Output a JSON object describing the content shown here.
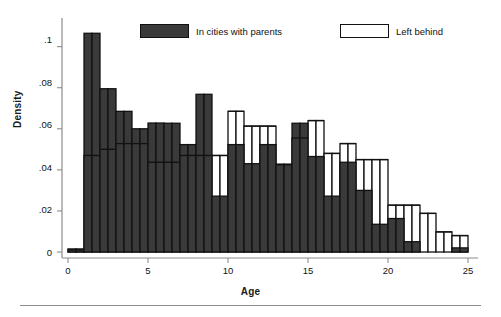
{
  "figure": {
    "x_axis_title": "Age",
    "y_axis_title": "Density",
    "y_ticks": [
      "0",
      ".02",
      ".04",
      ".06",
      ".08",
      ".1"
    ],
    "x_ticks": [
      "0",
      "5",
      "10",
      "15",
      "20",
      "25"
    ]
  },
  "legend": {
    "position": "top-inside",
    "items": [
      {
        "label": "In cities with parents",
        "style": "filled",
        "color": "#3a3a3a"
      },
      {
        "label": "Left behind",
        "style": "hollow",
        "color": "#ffffff"
      }
    ]
  },
  "colors": {
    "filled_bar": "#3a3a3a",
    "hollow_bar": "#ffffff",
    "bar_outline": "#111111",
    "axis": "#8c8c8c",
    "text": "#111111"
  },
  "chart_data": {
    "type": "bar",
    "subtype": "overlaid-histogram",
    "title": "",
    "xlabel": "Age",
    "ylabel": "Density",
    "xlim": [
      0,
      25
    ],
    "ylim": [
      0,
      0.112
    ],
    "bin_width": 0.5,
    "grid": false,
    "legend": [
      "In cities with parents",
      "Left behind"
    ],
    "x": [
      0.25,
      0.75,
      1.25,
      1.75,
      2.25,
      2.75,
      3.25,
      3.75,
      4.25,
      4.75,
      5.25,
      5.75,
      6.25,
      6.75,
      7.25,
      7.75,
      8.25,
      8.75,
      9.25,
      9.75,
      10.25,
      10.75,
      11.25,
      11.75,
      12.25,
      12.75,
      13.25,
      13.75,
      14.25,
      14.75,
      15.25,
      15.75,
      16.25,
      16.75,
      17.25,
      17.75,
      18.25,
      18.75,
      19.25,
      19.75,
      20.25,
      20.75,
      21.25,
      21.75,
      22.25,
      22.75,
      23.25,
      23.75,
      24.25,
      24.75
    ],
    "bin_left_edges": [
      0,
      0.5,
      1,
      1.5,
      2,
      2.5,
      3,
      3.5,
      4,
      4.5,
      5,
      5.5,
      6,
      6.5,
      7,
      7.5,
      8,
      8.5,
      9,
      9.5,
      10,
      10.5,
      11,
      11.5,
      12,
      12.5,
      13,
      13.5,
      14,
      14.5,
      15,
      15.5,
      16,
      16.5,
      17,
      17.5,
      18,
      18.5,
      19,
      19.5,
      20,
      20.5,
      21,
      21.5,
      22,
      22.5,
      23,
      23.5,
      24,
      24.5
    ],
    "series": [
      {
        "name": "In cities with parents",
        "style": "filled",
        "values": [
          0.0015,
          0.0015,
          0.1065,
          0.1065,
          0.0795,
          0.0795,
          0.0685,
          0.0685,
          0.06,
          0.06,
          0.0628,
          0.0628,
          0.0627,
          0.0627,
          0.0523,
          0.0523,
          0.0768,
          0.0768,
          0.0272,
          0.0272,
          0.0523,
          0.0523,
          0.043,
          0.043,
          0.0523,
          0.0523,
          0.0428,
          0.0428,
          0.0627,
          0.0627,
          0.0465,
          0.0465,
          0.0272,
          0.0272,
          0.0437,
          0.0437,
          0.03,
          0.03,
          0.0135,
          0.0135,
          0.0163,
          0.0163,
          0.005,
          0.005,
          0.0,
          0.0,
          0.0,
          0.0,
          0.002,
          0.002
        ]
      },
      {
        "name": "Left behind",
        "style": "hollow",
        "values": [
          0.001,
          0.001,
          0.047,
          0.047,
          0.05,
          0.05,
          0.0528,
          0.0528,
          0.0528,
          0.0528,
          0.0437,
          0.0437,
          0.0437,
          0.0437,
          0.047,
          0.047,
          0.047,
          0.047,
          0.047,
          0.047,
          0.0685,
          0.0685,
          0.0613,
          0.0613,
          0.0613,
          0.0613,
          0.0425,
          0.0425,
          0.0555,
          0.0555,
          0.064,
          0.064,
          0.048,
          0.048,
          0.0528,
          0.0528,
          0.045,
          0.045,
          0.045,
          0.045,
          0.0228,
          0.0228,
          0.0228,
          0.0228,
          0.0188,
          0.0188,
          0.0098,
          0.0098,
          0.008,
          0.008
        ]
      }
    ]
  },
  "geometry": {
    "plot_left": 68,
    "plot_right": 468,
    "baseline_y": 252,
    "top_y": 22,
    "y_per_unit_px": 2125,
    "px_per_age": 16
  }
}
